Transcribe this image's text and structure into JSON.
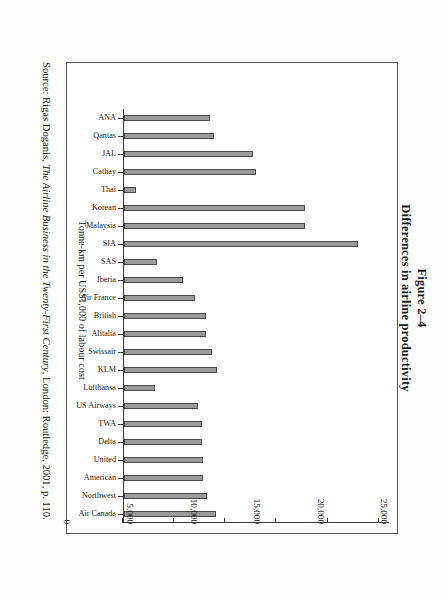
{
  "figure": {
    "number_label": "Figure 2–4",
    "title": "Differences in airline productivity"
  },
  "source_note": {
    "prefix": "Source: Rigas Doganis, ",
    "book_title": "The Airline Business in the Twenty-First Century",
    "suffix": ", London: Routledge, 2001, p. 110."
  },
  "axis": {
    "value_axis_title": "Tonne-km per US$1,000 of labour cost",
    "tick_labels": [
      "0",
      "5,000",
      "10,000",
      "15,000",
      "20,000",
      "25,000"
    ]
  },
  "colors": {
    "bar_fill": "#9a9a9a",
    "bar_stroke": "#4a4a4a",
    "axis": "#3a3a3a",
    "frame": "#555555",
    "page_background": "#fdfdfc"
  },
  "chart_data": {
    "type": "bar",
    "title": "Differences in airline productivity",
    "xlabel": "",
    "ylabel": "Tonne-km per US$1,000 of labour cost",
    "ylim": [
      0,
      26000
    ],
    "grid": false,
    "legend": "none",
    "orientation": "vertical-bars-on-rotated-page",
    "tick_values": [
      0,
      5000,
      10000,
      15000,
      20000,
      25000
    ],
    "categories": [
      "ANA",
      "Qantas",
      "JAL",
      "Cathay",
      "Thai",
      "Korean",
      "Malaysia",
      "SIA",
      "SAS",
      "Iberia",
      "Air France",
      "British",
      "Alitalia",
      "Swissair",
      "KLM",
      "Lufthansa",
      "US Airways",
      "TWA",
      "Delta",
      "United",
      "American",
      "Northwest",
      "Air Canada"
    ],
    "values": [
      8400,
      8800,
      12700,
      13000,
      1200,
      17800,
      17800,
      23000,
      3200,
      5800,
      7000,
      8000,
      8000,
      8600,
      9100,
      3000,
      7300,
      7700,
      7700,
      7800,
      7800,
      8100,
      9000
    ]
  }
}
